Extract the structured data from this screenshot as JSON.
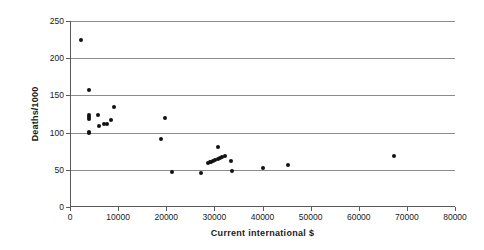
{
  "chart_data": {
    "type": "scatter",
    "title": "",
    "xlabel": "Current international  $",
    "ylabel": "Deaths/1000",
    "xlim": [
      0,
      80000
    ],
    "ylim": [
      0,
      250
    ],
    "xticks": [
      0,
      10000,
      20000,
      30000,
      40000,
      50000,
      60000,
      70000,
      80000
    ],
    "yticks": [
      0,
      50,
      100,
      150,
      200,
      250
    ],
    "xtick_labels": [
      "0",
      "10000",
      "20000",
      "30000",
      "40000",
      "50000",
      "60000",
      "70000",
      "80000"
    ],
    "ytick_labels": [
      "0",
      "50",
      "100",
      "150",
      "200",
      "250"
    ],
    "grid": "horizontal",
    "legend": null,
    "marker_color": "#121212",
    "gridline_color": "#8c8c8c",
    "axis_color": "#5a5a5a",
    "background_color": "#ffffff",
    "points": [
      {
        "x": 2300,
        "y": 225
      },
      {
        "x": 4000,
        "y": 157
      },
      {
        "x": 9200,
        "y": 135
      },
      {
        "x": 3900,
        "y": 124
      },
      {
        "x": 4000,
        "y": 121
      },
      {
        "x": 4050,
        "y": 118
      },
      {
        "x": 5900,
        "y": 123
      },
      {
        "x": 8500,
        "y": 117
      },
      {
        "x": 6100,
        "y": 109
      },
      {
        "x": 7100,
        "y": 111
      },
      {
        "x": 7600,
        "y": 112
      },
      {
        "x": 3850,
        "y": 101
      },
      {
        "x": 4000,
        "y": 100
      },
      {
        "x": 19700,
        "y": 119
      },
      {
        "x": 19000,
        "y": 91
      },
      {
        "x": 21200,
        "y": 47
      },
      {
        "x": 27200,
        "y": 46
      },
      {
        "x": 30700,
        "y": 81
      },
      {
        "x": 32300,
        "y": 69
      },
      {
        "x": 33400,
        "y": 62
      },
      {
        "x": 28700,
        "y": 59
      },
      {
        "x": 29100,
        "y": 60
      },
      {
        "x": 29400,
        "y": 61
      },
      {
        "x": 29800,
        "y": 62
      },
      {
        "x": 30200,
        "y": 63
      },
      {
        "x": 30700,
        "y": 65
      },
      {
        "x": 31100,
        "y": 66
      },
      {
        "x": 31500,
        "y": 67
      },
      {
        "x": 33600,
        "y": 48
      },
      {
        "x": 40200,
        "y": 52
      },
      {
        "x": 45200,
        "y": 56
      },
      {
        "x": 67300,
        "y": 68
      }
    ]
  }
}
